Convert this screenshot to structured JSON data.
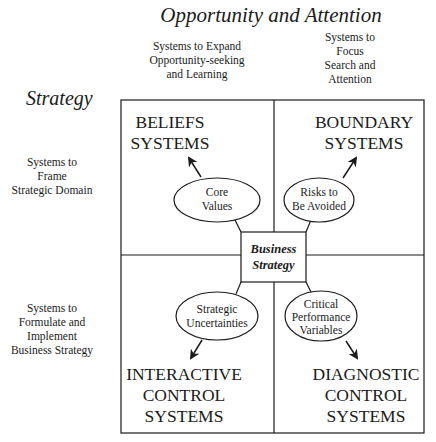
{
  "diagram": {
    "top_axis_title": "Opportunity and Attention",
    "left_axis_title": "Strategy",
    "column_headers": [
      {
        "lines": [
          "Systems to Expand",
          "Opportunity-seeking",
          "and Learning"
        ]
      },
      {
        "lines": [
          "Systems to",
          "Focus",
          "Search and",
          "Attention"
        ]
      }
    ],
    "row_headers": [
      {
        "lines": [
          "Systems to",
          "Frame",
          "Strategic Domain"
        ]
      },
      {
        "lines": [
          "Systems to",
          "Formulate and",
          "Implement",
          "Business Strategy"
        ]
      }
    ],
    "center": {
      "lines": [
        "Business",
        "Strategy"
      ]
    },
    "quadrants": [
      {
        "id": "beliefs",
        "title_lines": [
          "BELIEFS",
          "SYSTEMS"
        ],
        "oval_lines": [
          "Core",
          "Values"
        ]
      },
      {
        "id": "boundary",
        "title_lines": [
          "BOUNDARY",
          "SYSTEMS"
        ],
        "oval_lines": [
          "Risks to",
          "Be Avoided"
        ]
      },
      {
        "id": "interactive",
        "title_lines": [
          "INTERACTIVE",
          "CONTROL",
          "SYSTEMS"
        ],
        "oval_lines": [
          "Strategic",
          "Uncertainties"
        ]
      },
      {
        "id": "diagnostic",
        "title_lines": [
          "DIAGNOSTIC",
          "CONTROL",
          "SYSTEMS"
        ],
        "oval_lines": [
          "Critical",
          "Performance",
          "Variables"
        ]
      }
    ],
    "colors": {
      "ink": "#1a1a1a",
      "background": "#ffffff"
    }
  }
}
